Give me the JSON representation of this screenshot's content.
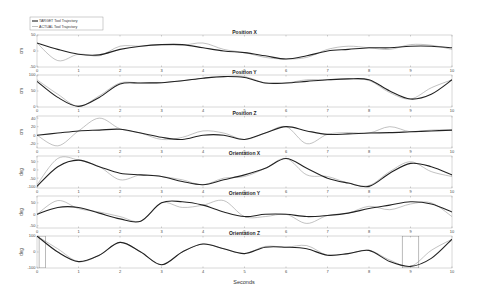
{
  "chart_data": {
    "type": "line",
    "figure_xlabel": "Seconds",
    "legend": {
      "position": "top-left",
      "entries": [
        {
          "label": "TARGET Tool Trajectory",
          "color": "#222222",
          "width": 1.1
        },
        {
          "label": "ACTUAL Tool Trajectory",
          "color": "#999999",
          "width": 0.6
        }
      ]
    },
    "xlim": [
      0,
      10
    ],
    "xticks": [
      0,
      1,
      2,
      3,
      4,
      5,
      6,
      7,
      8,
      9,
      10
    ],
    "subplots": [
      {
        "title": "Position X",
        "ylabel": "cm",
        "ylim": [
          -50,
          50
        ],
        "yticks": [
          50,
          0,
          -50
        ],
        "x": [
          0,
          0.5,
          1,
          1.5,
          2,
          2.5,
          3,
          3.5,
          4,
          4.5,
          5,
          5.5,
          6,
          6.5,
          7,
          7.5,
          8,
          8.5,
          9,
          9.5,
          10
        ],
        "target": [
          25,
          5,
          -10,
          -12,
          5,
          15,
          20,
          20,
          10,
          0,
          -5,
          -15,
          -25,
          -15,
          0,
          5,
          10,
          10,
          15,
          15,
          10
        ],
        "actual": [
          25,
          -30,
          -10,
          -15,
          15,
          15,
          20,
          18,
          25,
          5,
          -5,
          -20,
          -25,
          -20,
          5,
          15,
          10,
          5,
          20,
          18,
          5
        ]
      },
      {
        "title": "Position Y",
        "ylabel": "cm",
        "ylim": [
          0,
          100
        ],
        "yticks": [
          100,
          50,
          0
        ],
        "x": [
          0,
          0.5,
          1,
          1.5,
          2,
          2.5,
          3,
          3.5,
          4,
          4.5,
          5,
          5.5,
          6,
          6.5,
          7,
          7.5,
          8,
          8.5,
          9,
          9.5,
          10
        ],
        "target": [
          80,
          30,
          2,
          30,
          72,
          75,
          76,
          82,
          90,
          95,
          92,
          75,
          75,
          80,
          85,
          88,
          85,
          50,
          25,
          40,
          85
        ],
        "actual": [
          85,
          40,
          2,
          35,
          75,
          75,
          76,
          82,
          90,
          95,
          95,
          75,
          75,
          85,
          85,
          88,
          83,
          45,
          25,
          60,
          85
        ]
      },
      {
        "title": "Position Z",
        "ylabel": "cm",
        "ylim": [
          -30,
          45
        ],
        "yticks": [
          40,
          20,
          0,
          -20
        ],
        "x": [
          0,
          0.5,
          1,
          1.5,
          2,
          2.5,
          3,
          3.5,
          4,
          4.5,
          5,
          5.5,
          6,
          6.5,
          7,
          7.5,
          8,
          8.5,
          9,
          9.5,
          10
        ],
        "target": [
          0,
          5,
          10,
          12,
          14,
          5,
          -5,
          -10,
          0,
          0,
          -10,
          5,
          20,
          10,
          2,
          3,
          5,
          6,
          8,
          10,
          12
        ],
        "actual": [
          0,
          -25,
          10,
          40,
          15,
          5,
          -10,
          -5,
          10,
          5,
          -10,
          5,
          20,
          -20,
          2,
          6,
          5,
          20,
          8,
          12,
          12
        ]
      },
      {
        "title": "Orientation X",
        "ylabel": "deg",
        "ylim": [
          -110,
          85
        ],
        "yticks": [
          50,
          0,
          -50,
          -100
        ],
        "x": [
          0,
          0.5,
          1,
          1.5,
          2,
          2.5,
          3,
          3.5,
          4,
          4.5,
          5,
          5.5,
          6,
          6.5,
          7,
          7.5,
          8,
          8.5,
          9,
          9.5,
          10
        ],
        "target": [
          -100,
          20,
          60,
          20,
          -20,
          -30,
          -40,
          -70,
          -90,
          -60,
          -30,
          10,
          70,
          10,
          -50,
          -80,
          -100,
          -20,
          40,
          20,
          -30
        ],
        "actual": [
          -90,
          70,
          60,
          20,
          -60,
          -30,
          -40,
          -60,
          -90,
          -50,
          -40,
          10,
          70,
          -30,
          -40,
          -80,
          -95,
          -10,
          50,
          -10,
          -40
        ]
      },
      {
        "title": "Orientation Y",
        "ylabel": "deg",
        "ylim": [
          -60,
          80
        ],
        "yticks": [
          50,
          0,
          -50
        ],
        "x": [
          0,
          0.5,
          1,
          1.5,
          2,
          2.5,
          3,
          3.5,
          4,
          4.5,
          5,
          5.5,
          6,
          6.5,
          7,
          7.5,
          8,
          8.5,
          9,
          9.5,
          10
        ],
        "target": [
          0,
          30,
          30,
          5,
          -20,
          -30,
          50,
          55,
          40,
          10,
          -10,
          0,
          0,
          -10,
          -5,
          5,
          25,
          40,
          55,
          45,
          10
        ],
        "actual": [
          0,
          60,
          25,
          10,
          -10,
          -30,
          50,
          30,
          40,
          60,
          -10,
          -10,
          0,
          -40,
          -5,
          5,
          35,
          20,
          45,
          50,
          -10
        ]
      },
      {
        "title": "Orientation Z",
        "ylabel": "deg",
        "ylim": [
          -100,
          100
        ],
        "yticks": [
          100,
          0,
          -100
        ],
        "x": [
          0,
          0.5,
          1,
          1.5,
          2,
          2.5,
          3,
          3.5,
          4,
          4.5,
          5,
          5.5,
          6,
          6.5,
          7,
          7.5,
          8,
          8.5,
          9,
          9.5,
          10
        ],
        "target": [
          100,
          0,
          -60,
          -20,
          60,
          0,
          -80,
          0,
          50,
          20,
          -10,
          30,
          30,
          20,
          -20,
          -10,
          10,
          -60,
          -90,
          -40,
          80
        ],
        "actual": [
          100,
          20,
          -60,
          -20,
          60,
          0,
          -80,
          0,
          50,
          20,
          -10,
          35,
          30,
          40,
          -20,
          -10,
          10,
          -50,
          -90,
          10,
          80
        ],
        "actual_spikes": [
          {
            "x0": 0.05,
            "x1": 0.2,
            "low": -100,
            "high": 100
          },
          {
            "x0": 8.8,
            "x1": 9.2,
            "low": -100,
            "high": 100
          }
        ]
      }
    ]
  }
}
